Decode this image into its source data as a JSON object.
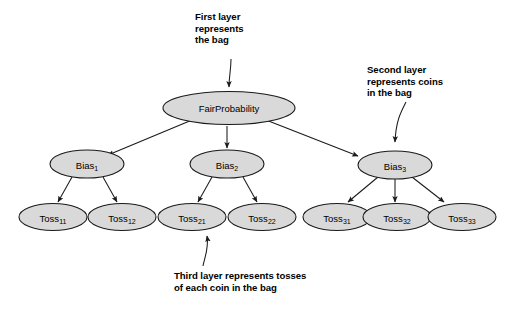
{
  "figure": {
    "type": "bayesian-network-tree",
    "background_color": "#ffffff",
    "node_fill_color": "#d9d9d9",
    "node_stroke_color": "#1a1a1a"
  },
  "annotations": {
    "first": "First layer\nrepresents\nthe bag",
    "second": "Second layer\nrepresents coins\nin the bag",
    "third": "Third layer represents tosses\nof each coin in the bag"
  },
  "layers": {
    "root": {
      "label": "FairProbability"
    },
    "bias": [
      {
        "base": "Bias",
        "sub": "1"
      },
      {
        "base": "Bias",
        "sub": "2"
      },
      {
        "base": "Bias",
        "sub": "3"
      }
    ],
    "toss": [
      {
        "base": "Toss",
        "sub": "11"
      },
      {
        "base": "Toss",
        "sub": "12"
      },
      {
        "base": "Toss",
        "sub": "21"
      },
      {
        "base": "Toss",
        "sub": "22"
      },
      {
        "base": "Toss",
        "sub": "31"
      },
      {
        "base": "Toss",
        "sub": "32"
      },
      {
        "base": "Toss",
        "sub": "33"
      }
    ]
  }
}
